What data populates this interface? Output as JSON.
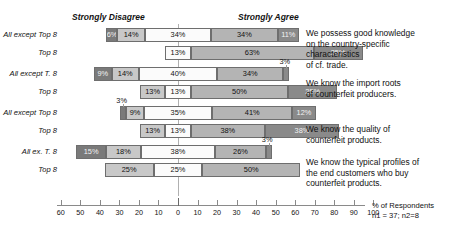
{
  "anchors": {
    "left": "Strongly Disagree",
    "right": "Strongly Agree"
  },
  "axis": {
    "ticks": [
      -60,
      -50,
      -40,
      -30,
      -20,
      -10,
      0,
      10,
      20,
      30,
      40,
      50,
      60,
      70,
      80,
      90,
      100
    ],
    "tick_labels": [
      "60",
      "50",
      "40",
      "30",
      "20",
      "10",
      "0",
      "10",
      "20",
      "30",
      "40",
      "50",
      "60",
      "70",
      "80",
      "90",
      "100"
    ],
    "caption_line1": "% of Respondents",
    "caption_line2": "n1 = 37; n2=8"
  },
  "statements": [
    "We possess good knowledge\non the country-specific\ncharacteristics\nof cf. trade.",
    "We know the import roots\nof counterfeit producers.",
    "We know the quality of\ncounterfeit products.",
    "We know the typical profiles of\nthe end customers who buy\ncounterfeit products."
  ],
  "chart_data": {
    "type": "bar",
    "subtype": "diverging-stacked-likert",
    "title": "",
    "xlabel": "% of Respondents",
    "ylabel": "",
    "xlim": [
      -60,
      100
    ],
    "grid": false,
    "zero_at": 0,
    "legend": [
      "Strongly Disagree",
      "Disagree",
      "Neutral",
      "Agree",
      "Strongly Agree"
    ],
    "categories": [
      "All except Top 8",
      "Top 8",
      "All except T. 8",
      "Top 8",
      "All except Top 8",
      "Top 8",
      "All ex. T. 8",
      "Top 8"
    ],
    "series": [
      {
        "name": "Strongly Disagree",
        "values": [
          6,
          0,
          9,
          0,
          3,
          0,
          15,
          0
        ]
      },
      {
        "name": "Disagree",
        "values": [
          14,
          0,
          14,
          13,
          9,
          13,
          18,
          25
        ]
      },
      {
        "name": "Neutral",
        "values": [
          34,
          13,
          40,
          13,
          35,
          13,
          38,
          25
        ]
      },
      {
        "name": "Agree",
        "values": [
          34,
          63,
          34,
          50,
          41,
          38,
          26,
          50
        ]
      },
      {
        "name": "Strongly Agree",
        "values": [
          11,
          25,
          3,
          25,
          12,
          38,
          3,
          0
        ]
      }
    ],
    "rows": [
      {
        "label": "All except Top 8",
        "group": "We possess good knowledge on the country-specific characteristics of cf. trade.",
        "segments": [
          {
            "key": "s1",
            "value": 6,
            "label": "6%",
            "label_visible": true,
            "outside": false
          },
          {
            "key": "s2",
            "value": 14,
            "label": "14%",
            "label_visible": true,
            "outside": false
          },
          {
            "key": "s3",
            "value": 34,
            "label": "34%",
            "label_visible": true,
            "outside": false
          },
          {
            "key": "s4",
            "value": 34,
            "label": "34%",
            "label_visible": true,
            "outside": false
          },
          {
            "key": "s5",
            "value": 11,
            "label": "11%",
            "label_visible": true,
            "outside": false
          }
        ]
      },
      {
        "label": "Top 8",
        "group": "We possess good knowledge on the country-specific characteristics of cf. trade.",
        "segments": [
          {
            "key": "s1",
            "value": 0,
            "label": "",
            "label_visible": false,
            "outside": false
          },
          {
            "key": "s2",
            "value": 0,
            "label": "",
            "label_visible": false,
            "outside": false
          },
          {
            "key": "s3",
            "value": 13,
            "label": "13%",
            "label_visible": true,
            "outside": false
          },
          {
            "key": "s4",
            "value": 63,
            "label": "63%",
            "label_visible": true,
            "outside": false
          },
          {
            "key": "s5",
            "value": 25,
            "label": "25%",
            "label_visible": true,
            "outside": false
          }
        ]
      },
      {
        "label": "All except T. 8",
        "group": "We know the import roots of counterfeit producers.",
        "segments": [
          {
            "key": "s1",
            "value": 9,
            "label": "9%",
            "label_visible": true,
            "outside": false
          },
          {
            "key": "s2",
            "value": 14,
            "label": "14%",
            "label_visible": true,
            "outside": false
          },
          {
            "key": "s3",
            "value": 40,
            "label": "40%",
            "label_visible": true,
            "outside": false
          },
          {
            "key": "s4",
            "value": 34,
            "label": "34%",
            "label_visible": true,
            "outside": false
          },
          {
            "key": "s5",
            "value": 3,
            "label": "3%",
            "label_visible": true,
            "outside": true
          }
        ]
      },
      {
        "label": "Top 8",
        "group": "We know the import roots of counterfeit producers.",
        "segments": [
          {
            "key": "s1",
            "value": 0,
            "label": "",
            "label_visible": false,
            "outside": false
          },
          {
            "key": "s2",
            "value": 13,
            "label": "13%",
            "label_visible": true,
            "outside": false
          },
          {
            "key": "s3",
            "value": 13,
            "label": "13%",
            "label_visible": true,
            "outside": false
          },
          {
            "key": "s4",
            "value": 50,
            "label": "50%",
            "label_visible": true,
            "outside": false
          },
          {
            "key": "s5",
            "value": 25,
            "label": "25%",
            "label_visible": true,
            "outside": false
          }
        ]
      },
      {
        "label": "All except Top 8",
        "group": "We know the quality of counterfeit products.",
        "segments": [
          {
            "key": "s1",
            "value": 3,
            "label": "3%",
            "label_visible": true,
            "outside": true
          },
          {
            "key": "s2",
            "value": 9,
            "label": "9%",
            "label_visible": true,
            "outside": false
          },
          {
            "key": "s3",
            "value": 35,
            "label": "35%",
            "label_visible": true,
            "outside": false
          },
          {
            "key": "s4",
            "value": 41,
            "label": "41%",
            "label_visible": true,
            "outside": false
          },
          {
            "key": "s5",
            "value": 12,
            "label": "12%",
            "label_visible": true,
            "outside": false
          }
        ]
      },
      {
        "label": "Top 8",
        "group": "We know the quality of counterfeit products.",
        "segments": [
          {
            "key": "s1",
            "value": 0,
            "label": "",
            "label_visible": false,
            "outside": false
          },
          {
            "key": "s2",
            "value": 13,
            "label": "13%",
            "label_visible": true,
            "outside": false
          },
          {
            "key": "s3",
            "value": 13,
            "label": "13%",
            "label_visible": true,
            "outside": false
          },
          {
            "key": "s4",
            "value": 38,
            "label": "38%",
            "label_visible": true,
            "outside": false
          },
          {
            "key": "s5",
            "value": 38,
            "label": "38%",
            "label_visible": true,
            "outside": false
          }
        ]
      },
      {
        "label": "All ex. T. 8",
        "group": "We know the typical profiles of the end customers who buy counterfeit products.",
        "segments": [
          {
            "key": "s1",
            "value": 15,
            "label": "15%",
            "label_visible": true,
            "outside": false
          },
          {
            "key": "s2",
            "value": 18,
            "label": "18%",
            "label_visible": true,
            "outside": false
          },
          {
            "key": "s3",
            "value": 38,
            "label": "38%",
            "label_visible": true,
            "outside": false
          },
          {
            "key": "s4",
            "value": 26,
            "label": "26%",
            "label_visible": true,
            "outside": false
          },
          {
            "key": "s5",
            "value": 3,
            "label": "3%",
            "label_visible": true,
            "outside": true
          }
        ]
      },
      {
        "label": "Top 8",
        "group": "We know the typical profiles of the end customers who buy counterfeit products.",
        "segments": [
          {
            "key": "s1",
            "value": 0,
            "label": "",
            "label_visible": false,
            "outside": false
          },
          {
            "key": "s2",
            "value": 25,
            "label": "25%",
            "label_visible": true,
            "outside": false
          },
          {
            "key": "s3",
            "value": 25,
            "label": "25%",
            "label_visible": true,
            "outside": false
          },
          {
            "key": "s4",
            "value": 50,
            "label": "50%",
            "label_visible": true,
            "outside": false
          },
          {
            "key": "s5",
            "value": 0,
            "label": "",
            "label_visible": false,
            "outside": false
          }
        ]
      }
    ]
  }
}
